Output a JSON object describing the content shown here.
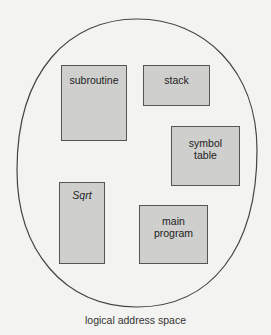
{
  "diagram": {
    "caption": "logical address space",
    "segments": [
      {
        "id": "subroutine",
        "label": "subroutine",
        "italic": false
      },
      {
        "id": "stack",
        "label": "stack",
        "italic": false
      },
      {
        "id": "symbol-table",
        "label_line1": "symbol",
        "label_line2": "table",
        "italic": false
      },
      {
        "id": "sqrt",
        "label": "Sqrt",
        "italic": true
      },
      {
        "id": "main-program",
        "label_line1": "main",
        "label_line2": "program",
        "italic": false
      }
    ],
    "colors": {
      "background": "#f3f3f1",
      "segment_fill": "#cfcfcd",
      "outline": "#555555"
    }
  }
}
